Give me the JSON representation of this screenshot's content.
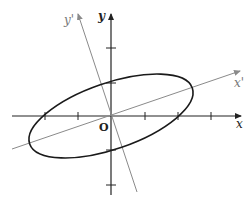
{
  "diagram": {
    "labels": {
      "x_axis": "x",
      "y_axis": "y",
      "x_prime_axis": "x'",
      "y_prime_axis": "y'",
      "origin": "O"
    },
    "colors": {
      "axis": "#222222",
      "rotated_axis": "#8a8a8a",
      "ellipse": "#1a1a1a",
      "rotated_label": "#777777",
      "background": "#ffffff"
    },
    "geometry": {
      "origin_px": [
        111,
        116
      ],
      "tick_spacing_px": 33,
      "x_ticks": [
        -2,
        -1,
        1,
        2,
        3
      ],
      "y_ticks": [
        2,
        1,
        -1,
        -2
      ],
      "ellipse_rotation_deg": -19,
      "ellipse_semi_major_px": 86,
      "ellipse_semi_minor_px": 33
    }
  }
}
